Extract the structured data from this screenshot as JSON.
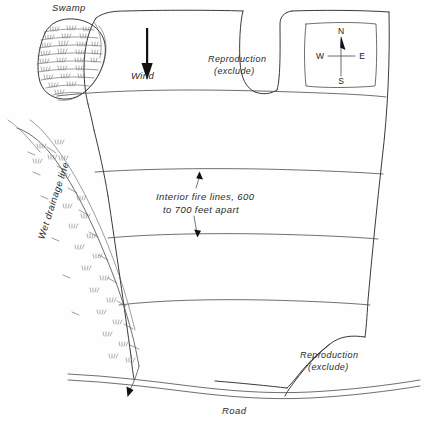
{
  "figure": {
    "name": "prescribed-burn-unit-map",
    "background_color": "#fefefe",
    "ink_color": "#3a3a3a"
  },
  "labels": {
    "swamp": "Swamp",
    "wind": "Wind",
    "reproduction_top_line1": "Reproduction",
    "reproduction_top_line2": "(exclude)",
    "reproduction_bottom_line1": "Reproduction",
    "reproduction_bottom_line2": "(exclude)",
    "fire_lines_line1": "Interior fire lines, 600",
    "fire_lines_line2": "to 700 feet apart",
    "wet_drainage": "Wet drainage line",
    "road": "Road"
  },
  "compass": {
    "north": "N",
    "south": "S",
    "east": "E",
    "west": "W"
  },
  "icons": {
    "wind_arrow": "wind-direction-arrow-icon",
    "compass_needle": "compass-needle-icon",
    "drainage_flow_arrow": "drainage-flow-arrow-icon",
    "swamp_hatch": "swamp-marsh-hatch-icon",
    "marsh_tuft": "marsh-grass-tuft-icon"
  }
}
